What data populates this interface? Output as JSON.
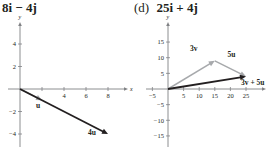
{
  "panels": [
    {
      "label": "",
      "expression": "8i − 4j"
    },
    {
      "label": "(d)",
      "expression": "25i + 4j"
    }
  ],
  "chart_data": [
    {
      "type": "line",
      "title": "8i − 4j",
      "xlabel": "x",
      "ylabel": "y",
      "xlim": [
        -1.5,
        10
      ],
      "ylim": [
        -5,
        6
      ],
      "xticks": [
        2,
        4,
        6,
        8
      ],
      "xtick_labels": [
        "",
        "4",
        "6",
        "8"
      ],
      "yticks": [
        4,
        2,
        -2,
        -4
      ],
      "ytick_labels": [
        "4",
        "2",
        "−2",
        "−4"
      ],
      "grid": false,
      "series": [
        {
          "name": "u",
          "from": [
            0,
            0
          ],
          "to": [
            2,
            -1
          ],
          "color": "#a7a9ac"
        },
        {
          "name": "4u",
          "from": [
            0,
            0
          ],
          "to": [
            8,
            -4
          ],
          "color": "#231f20"
        }
      ]
    },
    {
      "type": "line",
      "title": "25i + 4j",
      "xlabel": "x",
      "ylabel": "y",
      "xlim": [
        -7,
        30
      ],
      "ylim": [
        -17,
        20
      ],
      "xticks": [
        -5,
        5,
        10,
        15,
        20,
        25
      ],
      "xtick_labels": [
        "−5",
        "5",
        "10",
        "15",
        "20",
        "25"
      ],
      "yticks": [
        15,
        10,
        5,
        -5,
        -10,
        -15
      ],
      "ytick_labels": [
        "15",
        "10",
        "5",
        "−5",
        "−10",
        "−15"
      ],
      "grid": false,
      "series": [
        {
          "name": "3v",
          "from": [
            0,
            0
          ],
          "to": [
            15,
            9
          ],
          "color": "#a7a9ac"
        },
        {
          "name": "5u",
          "from": [
            15,
            9
          ],
          "to": [
            25,
            4
          ],
          "color": "#a7a9ac"
        },
        {
          "name": "3v + 5u",
          "from": [
            0,
            0
          ],
          "to": [
            25,
            4
          ],
          "color": "#231f20"
        }
      ]
    }
  ]
}
